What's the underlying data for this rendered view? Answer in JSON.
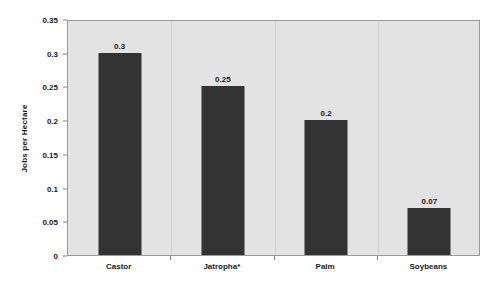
{
  "chart_data": {
    "type": "bar",
    "title": "",
    "subtitle": "",
    "xlabel": "",
    "ylabel": "Jobs per Hectare",
    "categories": [
      "Castor",
      "Jatropha*",
      "Palm",
      "Soybeans"
    ],
    "values": [
      0.3,
      0.25,
      0.2,
      0.07
    ],
    "value_labels": [
      "0.3",
      "0.25",
      "0.2",
      "0.07"
    ],
    "ylim": [
      0,
      0.35
    ],
    "ytick_values": [
      0,
      0.05,
      0.1,
      0.15,
      0.2,
      0.25,
      0.3,
      0.35
    ],
    "ytick_labels": [
      "0",
      "0.05",
      "0.1",
      "0.15",
      "0.2",
      "0.25",
      "0.3",
      "0.35"
    ],
    "grid": false,
    "legend": false,
    "legend_position": "none",
    "bar_color": "#333333",
    "plot_background": "#e3e3e3",
    "figure_background": "#ffffff",
    "axis_color": "#9a9a9a",
    "text_color": "#1a1a1a",
    "annotations": [
      "*"
    ]
  }
}
